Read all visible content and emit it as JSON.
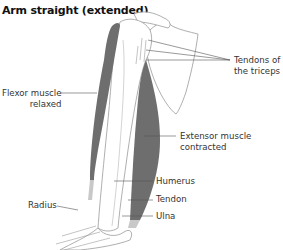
{
  "title": "Arm straight (extended)",
  "colors": {
    "muscle": "#6e6e6e",
    "outline": "#9a9a9a",
    "leader": "#555555",
    "text": "#333333"
  },
  "labels": {
    "tendons_triceps": [
      "Tendons of",
      "the triceps"
    ],
    "flexor": [
      "Flexor muscle",
      "relaxed"
    ],
    "extensor": [
      "Extensor muscle",
      "contracted"
    ],
    "humerus": "Humerus",
    "tendon": "Tendon",
    "radius": "Radius",
    "ulna": "Ulna"
  }
}
